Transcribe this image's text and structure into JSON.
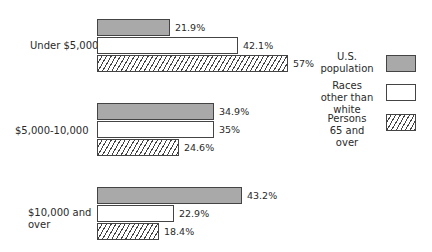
{
  "chart_data": {
    "type": "bar",
    "orientation": "horizontal",
    "title": "",
    "xlabel": "",
    "ylabel": "",
    "grid": false,
    "legend_position": "right",
    "categories": [
      "Under $5,000",
      "$5,000-10,000",
      "$10,000 and over"
    ],
    "series": [
      {
        "name": "U.S. population",
        "pattern": "solid-gray",
        "color": "#a9a9a9",
        "values": [
          21.9,
          34.9,
          43.2
        ],
        "labels": [
          "21.9%",
          "34.9%",
          "43.2%"
        ]
      },
      {
        "name": "Races other than white",
        "pattern": "white",
        "color": "#ffffff",
        "values": [
          42.1,
          35,
          22.9
        ],
        "labels": [
          "42.1%",
          "35%",
          "22.9%"
        ]
      },
      {
        "name": "Persons 65 and over",
        "pattern": "hatched",
        "color": "#444444",
        "values": [
          57,
          24.6,
          18.4
        ],
        "labels": [
          "57%",
          "24.6%",
          "18.4%"
        ]
      }
    ],
    "unit": "%"
  },
  "categories": [
    {
      "label": "Under $5,000"
    },
    {
      "label": "$5,000-10,000"
    },
    {
      "label_line1": "$10,000 and",
      "label_line2": "over"
    }
  ],
  "legend": [
    {
      "line1": "U.S.",
      "line2": "population"
    },
    {
      "line1": "Races",
      "line2": "other than",
      "line3": "white"
    },
    {
      "line1": "Persons",
      "line2": "65 and",
      "line3": "over"
    }
  ]
}
